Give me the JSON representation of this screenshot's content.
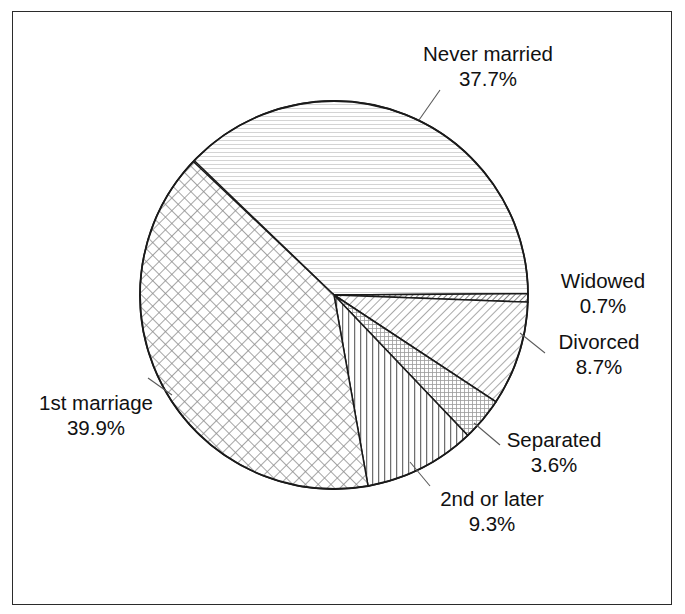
{
  "chart_data": {
    "type": "pie",
    "title": "",
    "subtitle": "",
    "xlabel": "",
    "ylabel": "",
    "legend_position": "none",
    "grid": false,
    "units": "percent",
    "start_angle_deg": 0,
    "direction": "clockwise",
    "categories": [
      "Never married",
      "Widowed",
      "Divorced",
      "Separated",
      "2nd or later",
      "1st marriage"
    ],
    "values": [
      37.7,
      0.7,
      8.7,
      3.6,
      9.3,
      39.9
    ],
    "slices": [
      {
        "id": "never-married",
        "label": "Never married",
        "value_label": "37.7%",
        "value": 37.7,
        "start_deg": 223.9,
        "end_deg": 359.6,
        "pattern": "horizontal-fine-lines",
        "pattern_color": "#c9c9c9"
      },
      {
        "id": "widowed",
        "label": "Widowed",
        "value_label": "0.7%",
        "value": 0.7,
        "start_deg": 359.6,
        "end_deg": 362.1,
        "pattern": "diagonal-dense-lines",
        "pattern_color": "#555555"
      },
      {
        "id": "divorced",
        "label": "Divorced",
        "value_label": "8.7%",
        "value": 8.7,
        "start_deg": 2.1,
        "end_deg": 33.4,
        "pattern": "diagonal-lines",
        "pattern_color": "#8a8a8a"
      },
      {
        "id": "separated",
        "label": "Separated",
        "value_label": "3.6%",
        "value": 3.6,
        "start_deg": 33.4,
        "end_deg": 46.4,
        "pattern": "fine-grid",
        "pattern_color": "#9a9a9a"
      },
      {
        "id": "second-or-later",
        "label": "2nd or later",
        "value_label": "9.3%",
        "value": 9.3,
        "start_deg": 46.4,
        "end_deg": 79.9,
        "pattern": "vertical-lines",
        "pattern_color": "#6f6f6f"
      },
      {
        "id": "first-marriage",
        "label": "1st marriage",
        "value_label": "39.9%",
        "value": 39.9,
        "start_deg": 79.9,
        "end_deg": 223.5,
        "pattern": "diagonal-crosshatch",
        "pattern_color": "#8f8f8f"
      }
    ],
    "geometry": {
      "center_x": 334,
      "center_y": 295,
      "radius": 194
    },
    "colors": {
      "outline": "#1a1a1a",
      "text": "#111111",
      "frame": "#2b2b2b",
      "background": "#ffffff"
    }
  }
}
